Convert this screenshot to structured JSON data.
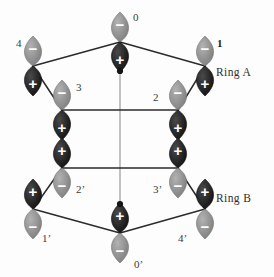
{
  "figure": {
    "background_color": "#fdfdfd",
    "lobe_positive_color": "#1b1b1b",
    "lobe_negative_color": "#8c8c8c",
    "sign_text_color": "#ffffff",
    "bond_color": "#2b2b2b",
    "axis_color": "#9a9a9a",
    "center_dot_color": "#141414",
    "label_color": "#3a3a3a"
  },
  "ring_labels": [
    {
      "id": "ring-a",
      "text": "Ring A",
      "x": 216,
      "y": 66
    },
    {
      "id": "ring-b",
      "text": "Ring B",
      "x": 216,
      "y": 192
    }
  ],
  "center_dots": [
    {
      "id": "center-dot-ring-a",
      "cx": 120,
      "cy": 71,
      "r": 3.1
    },
    {
      "id": "center-dot-ring-b",
      "cx": 120,
      "cy": 204,
      "r": 3.1
    }
  ],
  "axis_line": {
    "x1": 120,
    "y1": 71,
    "x2": 120,
    "y2": 204
  },
  "rings": [
    {
      "name": "Ring A",
      "id": "ring-a",
      "orientation": "minus-up-plus-down",
      "ring_bonds": [
        {
          "from": "4",
          "to": "0"
        },
        {
          "from": "0",
          "to": "1"
        },
        {
          "from": "4",
          "to": "3"
        },
        {
          "from": "1",
          "to": "2"
        },
        {
          "from": "3",
          "to": "2"
        }
      ],
      "orbitals": [
        {
          "id": "0",
          "label": "0",
          "cx": 120,
          "cy": 42,
          "upper_sign": "−",
          "lower_sign": "+",
          "label_dx": 13,
          "label_dy": -30,
          "bold": false
        },
        {
          "id": "1",
          "label": "1",
          "cx": 205,
          "cy": 66,
          "upper_sign": "−",
          "lower_sign": "+",
          "label_dx": 12,
          "label_dy": -28,
          "bold": true
        },
        {
          "id": "2",
          "label": "2",
          "cx": 178,
          "cy": 110,
          "upper_sign": "−",
          "lower_sign": "+",
          "label_dx": -25,
          "label_dy": -18,
          "bold": false
        },
        {
          "id": "3",
          "label": "3",
          "cx": 62,
          "cy": 110,
          "upper_sign": "−",
          "lower_sign": "+",
          "label_dx": 14,
          "label_dy": -28,
          "bold": false
        },
        {
          "id": "4",
          "label": "4",
          "cx": 33,
          "cy": 66,
          "upper_sign": "−",
          "lower_sign": "+",
          "label_dx": -17,
          "label_dy": -28,
          "bold": false
        }
      ]
    },
    {
      "name": "Ring B",
      "id": "ring-b",
      "orientation": "plus-up-minus-down",
      "ring_bonds": [
        {
          "from": "1'",
          "to": "0'"
        },
        {
          "from": "0'",
          "to": "4'"
        },
        {
          "from": "1'",
          "to": "2'"
        },
        {
          "from": "4'",
          "to": "3'"
        },
        {
          "from": "2'",
          "to": "3'"
        }
      ],
      "orbitals": [
        {
          "id": "2'",
          "label": "2’",
          "cx": 62,
          "cy": 168,
          "upper_sign": "+",
          "lower_sign": "−",
          "label_dx": 14,
          "label_dy": 16,
          "bold": false
        },
        {
          "id": "3'",
          "label": "3’",
          "cx": 178,
          "cy": 168,
          "upper_sign": "+",
          "lower_sign": "−",
          "label_dx": -25,
          "label_dy": 16,
          "bold": false
        },
        {
          "id": "1'",
          "label": "1’",
          "cx": 33,
          "cy": 209,
          "upper_sign": "+",
          "lower_sign": "−",
          "label_dx": 9,
          "label_dy": 24,
          "bold": false
        },
        {
          "id": "4'",
          "label": "4’",
          "cx": 205,
          "cy": 209,
          "upper_sign": "+",
          "lower_sign": "−",
          "label_dx": -27,
          "label_dy": 24,
          "bold": false
        },
        {
          "id": "0'",
          "label": "0’",
          "cx": 120,
          "cy": 233,
          "upper_sign": "+",
          "lower_sign": "−",
          "label_dx": 14,
          "label_dy": 26,
          "bold": false
        }
      ]
    }
  ]
}
